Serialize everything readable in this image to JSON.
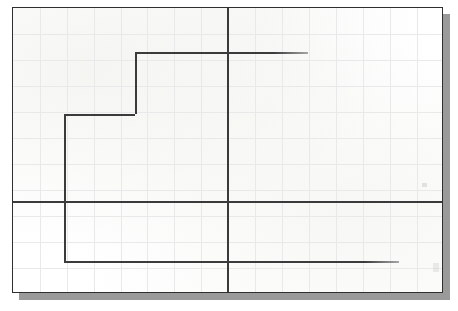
{
  "document": {
    "kind": "scanned-graph-paper-sheet",
    "title": "Step waveform on graph paper",
    "sheet": {
      "x": 12,
      "y": 7,
      "width": 431,
      "height": 286,
      "background_color": "#ffffff",
      "border_color": "#2f2f2f",
      "border_width_px": 1.5,
      "shadow_color": "#9a9a9a",
      "shadow_offset_px": 7
    },
    "grid": {
      "visible": true,
      "line_color": "#e9e9e9",
      "cell_width_px": 26.9,
      "cell_height_px": 26.0,
      "columns": 16,
      "rows": 11,
      "vertical_positions": [
        27,
        54,
        81,
        108,
        134,
        161,
        188,
        215,
        242,
        269,
        296,
        323,
        350,
        377,
        404
      ],
      "horizontal_positions": [
        26,
        52,
        78,
        104,
        130,
        156,
        182,
        208,
        234,
        260
      ]
    },
    "ink": {
      "color": "#3b3b3b",
      "stroke_width_px": 1.6
    }
  },
  "chart_data": {
    "type": "line",
    "title": "",
    "subtitle": "",
    "xlabel": "",
    "ylabel": "",
    "grid": true,
    "legend": null,
    "axes": {
      "x_axis": {
        "description": "horizontal reference axis",
        "y_px": 200,
        "x_start_px": 12,
        "x_end_px": 443,
        "color": "#3a3a3a"
      },
      "y_axis": {
        "description": "vertical reference axis",
        "x_px": 226,
        "y_start_px": 7,
        "y_end_px": 293,
        "color": "#3a3a3a"
      },
      "origin_px": {
        "x": 226,
        "y": 200
      }
    },
    "series": [
      {
        "name": "step-waveform",
        "style": "step",
        "color": "#3b3b3b",
        "points_px": [
          {
            "x": 63,
            "y": 260
          },
          {
            "x": 63,
            "y": 113
          },
          {
            "x": 134,
            "y": 113
          },
          {
            "x": 134,
            "y": 51
          },
          {
            "x": 307,
            "y": 51
          }
        ],
        "segments": [
          {
            "orientation": "vertical",
            "x": 63,
            "y1": 113,
            "y2": 260,
            "length_px": 147
          },
          {
            "orientation": "horizontal",
            "y": 113,
            "x1": 63,
            "x2": 134,
            "length_px": 71
          },
          {
            "orientation": "vertical",
            "x": 134,
            "y1": 51,
            "y2": 113,
            "length_px": 62
          },
          {
            "orientation": "horizontal",
            "y": 51,
            "x1": 134,
            "x2": 307,
            "length_px": 173
          }
        ]
      },
      {
        "name": "baseline-trace",
        "style": "straight",
        "color": "#3b3b3b",
        "points_px": [
          {
            "x": 63,
            "y": 260
          },
          {
            "x": 398,
            "y": 260
          }
        ],
        "segments": [
          {
            "orientation": "horizontal",
            "y": 260,
            "x1": 63,
            "x2": 398,
            "length_px": 335
          }
        ]
      }
    ],
    "annotations": [],
    "tick_labels": {
      "x": [],
      "y": []
    }
  }
}
